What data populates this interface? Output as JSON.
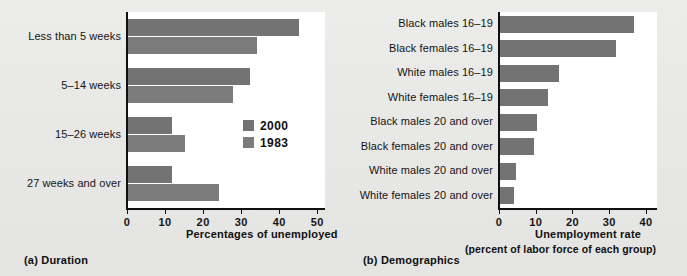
{
  "figure": {
    "background_color": "#e8e8e6",
    "plot_background_color": "#ffffff",
    "bar_color_2000": "#737373",
    "bar_color_1983": "#7b7b7b"
  },
  "panel_a": {
    "caption": "(a) Duration",
    "legend": {
      "items": [
        {
          "label": "2000",
          "color": "#737373"
        },
        {
          "label": "1983",
          "color": "#7b7b7b"
        }
      ]
    }
  },
  "panel_b": {
    "caption": "(b) Demographics"
  },
  "chart_data": [
    {
      "type": "bar",
      "orientation": "horizontal",
      "title": "",
      "panel": "(a) Duration",
      "categories": [
        "Less than 5 weeks",
        "5–14 weeks",
        "15–26 weeks",
        "27 weeks and over"
      ],
      "series": [
        {
          "name": "2000",
          "values": [
            45.0,
            32.0,
            11.5,
            11.5
          ]
        },
        {
          "name": "1983",
          "values": [
            34.0,
            27.5,
            15.0,
            24.0
          ]
        }
      ],
      "xlabel": "Percentages of unemployed",
      "ylabel": "",
      "xlim": [
        0,
        52
      ],
      "xticks": [
        0,
        10,
        20,
        30,
        40,
        50
      ],
      "xticklabels": [
        "0",
        "10",
        "20",
        "30",
        "40",
        "50"
      ],
      "grid": false,
      "legend_position": "inside-right"
    },
    {
      "type": "bar",
      "orientation": "horizontal",
      "title": "",
      "panel": "(b) Demographics",
      "categories": [
        "Black males 16–19",
        "Black females 16–19",
        "White males 16–19",
        "White females 16–19",
        "Black males 20 and over",
        "Black females 20 and over",
        "White males 20 and over",
        "White females 20 and over"
      ],
      "values": [
        36.5,
        31.5,
        16.0,
        13.0,
        10.0,
        9.3,
        4.3,
        3.9
      ],
      "xlabel": "Unemployment rate",
      "xlabel_sub": "(percent of labor force of each group)",
      "ylabel": "",
      "xlim": [
        0,
        43
      ],
      "xticks": [
        0,
        10,
        20,
        30,
        40
      ],
      "xticklabels": [
        "0",
        "10",
        "20",
        "30",
        "40"
      ],
      "grid": false,
      "legend_position": "none"
    }
  ]
}
